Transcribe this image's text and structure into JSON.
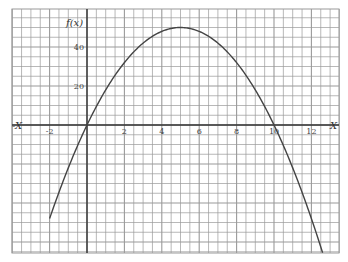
{
  "chart_data": {
    "type": "line",
    "title": "",
    "function": "f(x) = 20x - 2x^2",
    "xlabel": "X",
    "xlabel_left": "-X",
    "ylabel": "f(x)",
    "x_ticks": [
      "-2",
      "0",
      "2",
      "4",
      "6",
      "8",
      "10",
      "12"
    ],
    "y_ticks": [
      "20",
      "40"
    ],
    "xlim": [
      -4,
      13.5
    ],
    "ylim": [
      -65,
      60
    ],
    "grid": true,
    "series": [
      {
        "name": "f(x)",
        "x": [
          -2,
          -1,
          0,
          1,
          2,
          3,
          4,
          5,
          6,
          7,
          8,
          9,
          10,
          11,
          12,
          12.6
        ],
        "y": [
          -48,
          -22,
          0,
          18,
          32,
          42,
          48,
          50,
          48,
          42,
          32,
          18,
          0,
          -22,
          -48,
          -65.5
        ]
      }
    ],
    "annotations": {
      "roots": [
        0,
        10
      ],
      "vertex": [
        5,
        50
      ]
    }
  },
  "colors": {
    "grid": "#9a9a9a",
    "axis": "#333333",
    "curve": "#444444",
    "background": "#ffffff"
  }
}
